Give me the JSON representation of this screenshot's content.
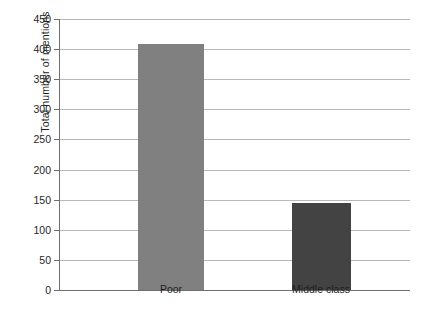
{
  "chart_data": {
    "type": "bar",
    "title": "",
    "xlabel": "",
    "ylabel": "Total number of mentions",
    "categories": [
      "Poor",
      "Middle class"
    ],
    "values": [
      409,
      144
    ],
    "ylim": [
      0,
      450
    ],
    "ytick_labels": [
      "0",
      "50",
      "100",
      "150",
      "200",
      "250",
      "300",
      "350",
      "400",
      "450"
    ],
    "ytick_values": [
      0,
      50,
      100,
      150,
      200,
      250,
      300,
      350,
      400,
      450
    ],
    "grid": "horizontal",
    "legend": "none",
    "bar_colors": [
      "#808080",
      "#434343"
    ],
    "series": [
      {
        "name": "Total number of mentions",
        "points": [
          {
            "category": "Poor",
            "value": 409,
            "color": "#808080"
          },
          {
            "category": "Middle class",
            "value": 144,
            "color": "#434343"
          }
        ]
      }
    ]
  },
  "axis_colors": {
    "axis_line": "#6e6e6e",
    "gridline": "#b8b8b8",
    "text": "#1f1f1f",
    "background": "#ffffff"
  }
}
